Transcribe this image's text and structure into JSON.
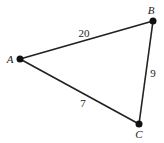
{
  "diagram": {
    "type": "weighted-graph-triangle",
    "vertices": [
      {
        "id": "A",
        "label": "A",
        "x": 20,
        "y": 59,
        "label_x": 10,
        "label_y": 63
      },
      {
        "id": "B",
        "label": "B",
        "x": 153,
        "y": 21,
        "label_x": 151,
        "label_y": 14
      },
      {
        "id": "C",
        "label": "C",
        "x": 139,
        "y": 124,
        "label_x": 139,
        "label_y": 138
      }
    ],
    "edges": [
      {
        "from": "A",
        "to": "B",
        "weight": "20",
        "label_x": 84,
        "label_y": 37
      },
      {
        "from": "B",
        "to": "C",
        "weight": "9",
        "label_x": 153,
        "label_y": 77
      },
      {
        "from": "A",
        "to": "C",
        "weight": "7",
        "label_x": 83,
        "label_y": 107
      }
    ],
    "colors": {
      "stroke": "#222222",
      "node": "#111111",
      "background": "#ffffff"
    }
  }
}
